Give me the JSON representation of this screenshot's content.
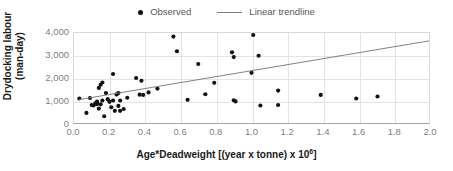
{
  "chart_data": {
    "type": "scatter",
    "title": "",
    "xlabel": "Age*Deadweight [(year x tonne) x 10^6]",
    "xlabel_main": "Age*Deadweight [(year x tonne) x 10",
    "xlabel_exp": "6",
    "xlabel_tail": "]",
    "ylabel_line1": "Drydocking labour",
    "ylabel_line2": "(man-day)",
    "xlim": [
      0.0,
      2.0
    ],
    "ylim": [
      0,
      4000
    ],
    "xticks": [
      "0.0",
      "0.2",
      "0.4",
      "0.6",
      "0.8",
      "1.0",
      "1.2",
      "1.4",
      "1.6",
      "1.8",
      "2.0"
    ],
    "xtick_values": [
      0.0,
      0.2,
      0.4,
      0.6,
      0.8,
      1.0,
      1.2,
      1.4,
      1.6,
      1.8,
      2.0
    ],
    "yticks": [
      "0",
      "1,000",
      "2,000",
      "3,000",
      "4,000"
    ],
    "ytick_values": [
      0,
      1000,
      2000,
      3000,
      4000
    ],
    "grid": true,
    "legend_position": "top-center",
    "series": [
      {
        "name": "Observed",
        "type": "scatter",
        "marker": "circle",
        "color": "#111111",
        "points": [
          [
            0.03,
            1090
          ],
          [
            0.07,
            450
          ],
          [
            0.09,
            1110
          ],
          [
            0.1,
            800
          ],
          [
            0.11,
            780
          ],
          [
            0.12,
            870
          ],
          [
            0.13,
            950
          ],
          [
            0.13,
            840
          ],
          [
            0.14,
            640
          ],
          [
            0.14,
            1560
          ],
          [
            0.15,
            1700
          ],
          [
            0.15,
            830
          ],
          [
            0.16,
            1800
          ],
          [
            0.16,
            1000
          ],
          [
            0.17,
            300
          ],
          [
            0.18,
            1330
          ],
          [
            0.19,
            1060
          ],
          [
            0.2,
            940
          ],
          [
            0.21,
            700
          ],
          [
            0.22,
            2180
          ],
          [
            0.22,
            1000
          ],
          [
            0.23,
            540
          ],
          [
            0.24,
            1270
          ],
          [
            0.25,
            1330
          ],
          [
            0.25,
            760
          ],
          [
            0.26,
            1000
          ],
          [
            0.26,
            540
          ],
          [
            0.28,
            620
          ],
          [
            0.3,
            1120
          ],
          [
            0.35,
            2000
          ],
          [
            0.37,
            1260
          ],
          [
            0.38,
            1880
          ],
          [
            0.39,
            1250
          ],
          [
            0.42,
            1360
          ],
          [
            0.47,
            1530
          ],
          [
            0.56,
            3840
          ],
          [
            0.58,
            3190
          ],
          [
            0.64,
            1030
          ],
          [
            0.7,
            2620
          ],
          [
            0.74,
            1280
          ],
          [
            0.79,
            1790
          ],
          [
            0.89,
            3140
          ],
          [
            0.9,
            2930
          ],
          [
            0.9,
            1010
          ],
          [
            0.91,
            960
          ],
          [
            1.0,
            2230
          ],
          [
            1.01,
            3910
          ],
          [
            1.04,
            2990
          ],
          [
            1.05,
            780
          ],
          [
            1.15,
            1440
          ],
          [
            1.15,
            800
          ],
          [
            1.39,
            1250
          ],
          [
            1.59,
            1090
          ],
          [
            1.71,
            1180
          ]
        ]
      },
      {
        "name": "Linear trendline",
        "type": "line",
        "color": "#808080",
        "endpoints": [
          [
            0.03,
            1040
          ],
          [
            2.0,
            3650
          ]
        ]
      }
    ],
    "legend": [
      {
        "label": "Observed",
        "marker": "dot",
        "color": "#111111"
      },
      {
        "label": "Linear trendline",
        "marker": "line",
        "color": "#7f7f7f"
      }
    ]
  },
  "style": {
    "marker_color": "#111111",
    "trend_color": "#808080",
    "grid_color": "#e4e4e4",
    "axis_color": "#a6a6a6",
    "tick_text_color": "#7f7f7f",
    "title_text_color": "#1a1a1a",
    "background": "#ffffff"
  }
}
